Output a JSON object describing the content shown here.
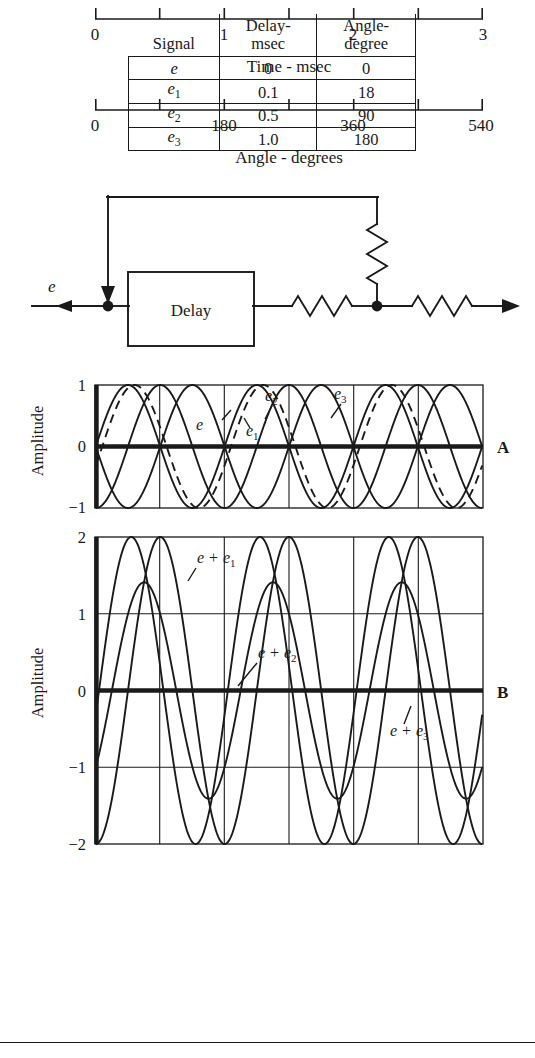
{
  "table": {
    "headers": [
      "Signal",
      "Delay-\nmsec",
      "Angle-\ndegree"
    ],
    "header_signal": "Signal",
    "header_delay_line1": "Delay-",
    "header_delay_line2": "msec",
    "header_angle_line1": "Angle-",
    "header_angle_line2": "degree",
    "rows": [
      {
        "signal": "e",
        "signal_sub": "",
        "delay": "0",
        "angle": "0"
      },
      {
        "signal": "e",
        "signal_sub": "1",
        "delay": "0.1",
        "angle": "18"
      },
      {
        "signal": "e",
        "signal_sub": "2",
        "delay": "0.5",
        "angle": "90"
      },
      {
        "signal": "e",
        "signal_sub": "3",
        "delay": "1.0",
        "angle": "180"
      }
    ]
  },
  "circuit": {
    "input_label": "e",
    "delay_block_label": "Delay",
    "elements": [
      "input-arrow",
      "junction-dot",
      "delay-block",
      "series-resistor-1",
      "junction-dot-2",
      "shunt-resistor",
      "feedback-wire",
      "series-resistor-2",
      "output-arrow"
    ]
  },
  "panelA": {
    "letter": "A",
    "ylabel": "Amplitude",
    "yticks": [
      "1",
      "0",
      "-1"
    ],
    "curve_labels": [
      "e",
      "e₁",
      "e₂",
      "e₃"
    ],
    "label_e": "e",
    "label_e1_base": "e",
    "label_e1_sub": "1",
    "label_e2_base": "e",
    "label_e2_sub": "2",
    "label_e3_base": "e",
    "label_e3_sub": "3"
  },
  "panelB": {
    "letter": "B",
    "ylabel": "Amplitude",
    "yticks": [
      "2",
      "1",
      "0",
      "-1",
      "-2"
    ],
    "label_ee1_base": "e + e",
    "label_ee1_sub": "1",
    "label_ee2_base": "e + e",
    "label_ee2_sub": "2",
    "label_ee3_base": "e + e",
    "label_ee3_sub": "3"
  },
  "xaxis_time": {
    "caption": "Time - msec",
    "tick_labels": [
      "0",
      "1",
      "2",
      "3"
    ],
    "tick_values": [
      0,
      0.5,
      1,
      1.5,
      2,
      2.5,
      3
    ],
    "labeled_values": [
      0,
      1,
      2,
      3
    ]
  },
  "xaxis_angle": {
    "caption": "Angle - degrees",
    "tick_labels": [
      "0",
      "180",
      "360",
      "540"
    ],
    "tick_values": [
      0,
      90,
      180,
      270,
      360,
      450,
      540
    ],
    "labeled_values": [
      0,
      180,
      360,
      540
    ]
  },
  "chart_data": {
    "type": "line",
    "xlabel": "Time - msec",
    "xlabel_secondary": "Angle - degrees",
    "ylabel": "Amplitude",
    "xlim": [
      0,
      3
    ],
    "x_secondary_lim": [
      0,
      540
    ],
    "grid": true,
    "panels": [
      {
        "id": "A",
        "ylim": [
          -1,
          1
        ],
        "yticks": [
          -1,
          0,
          1
        ],
        "note": "Four unit-amplitude 1 kHz sinusoids, each progressively delayed.",
        "series": [
          {
            "name": "e",
            "label": "e",
            "style": "solid",
            "amplitude": 1,
            "period_msec": 1,
            "delay_msec": 0,
            "phase_deg": 0
          },
          {
            "name": "e1",
            "label": "e₁",
            "style": "dashed",
            "amplitude": 1,
            "period_msec": 1,
            "delay_msec": 0.1,
            "phase_deg": 18
          },
          {
            "name": "e2",
            "label": "e₂",
            "style": "solid",
            "amplitude": 1,
            "period_msec": 1,
            "delay_msec": 0.5,
            "phase_deg": 90
          },
          {
            "name": "e3",
            "label": "e₃",
            "style": "solid",
            "amplitude": 1,
            "period_msec": 1,
            "delay_msec": 1.0,
            "phase_deg": 180
          }
        ]
      },
      {
        "id": "B",
        "ylim": [
          -2,
          2
        ],
        "yticks": [
          -2,
          -1,
          0,
          1,
          2
        ],
        "note": "Sum of the direct signal with each delayed replica.",
        "series": [
          {
            "name": "e+e1",
            "label": "e + e₁",
            "style": "solid",
            "peak_amplitude": 2.0,
            "period_msec": 1,
            "phase_deg": 9
          },
          {
            "name": "e+e2",
            "label": "e + e₂",
            "style": "solid",
            "peak_amplitude": 1.41,
            "period_msec": 1,
            "phase_deg": 45
          },
          {
            "name": "e+e3",
            "label": "e + e₃",
            "style": "solid",
            "peak_amplitude": 2.0,
            "period_msec": 1,
            "phase_deg": 90
          }
        ]
      }
    ]
  }
}
